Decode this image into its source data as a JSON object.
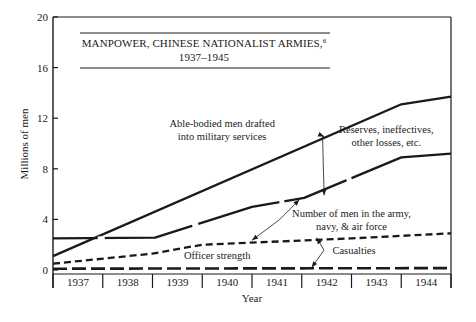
{
  "chart_data": {
    "type": "line",
    "title": "MANPOWER, CHINESE NATIONALIST ARMIES,",
    "title_footnote": "6",
    "subtitle": "1937–1945",
    "xlabel": "Year",
    "ylabel": "Millions of men",
    "ylim": [
      0,
      20
    ],
    "xlim": [
      1937,
      1945
    ],
    "yticks": [
      0,
      4,
      8,
      12,
      16,
      20
    ],
    "categories": [
      "1937",
      "1938",
      "1939",
      "1940",
      "1941",
      "1942",
      "1943",
      "1944"
    ],
    "grid": false,
    "legend": "none (inline annotations with arrows)",
    "series": [
      {
        "name": "Able-bodied men drafted into military services",
        "style": "solid",
        "x": [
          1937.0,
          1944.0,
          1945.0
        ],
        "values": [
          1.1,
          13.1,
          13.7
        ]
      },
      {
        "name": "Number of men in the army, navy, & air force",
        "style": "solid-broken",
        "x": [
          1937.0,
          1939.05,
          1941.0,
          1942.05,
          1944.0,
          1945.0
        ],
        "values": [
          2.5,
          2.55,
          5.0,
          5.7,
          8.9,
          9.2
        ]
      },
      {
        "name": "Officer strength",
        "style": "dashed",
        "x": [
          1937.0,
          1939.0,
          1940.0,
          1943.0,
          1945.0
        ],
        "values": [
          0.5,
          1.3,
          2.0,
          2.5,
          2.9
        ]
      },
      {
        "name": "Casualties",
        "style": "long-dashed",
        "x": [
          1937.0,
          1945.0
        ],
        "values": [
          0.1,
          0.15
        ]
      }
    ],
    "annotations": [
      {
        "text_lines": [
          "Able-bodied men drafted",
          "into military services"
        ],
        "x": 1940.4,
        "y": 11.3
      },
      {
        "text_lines": [
          "Reserves, ineffectives,",
          "other losses, etc."
        ],
        "x": 1943.7,
        "y": 10.8,
        "arrows_to": [
          [
            1942.45,
            10.55
          ],
          [
            1942.45,
            5.9
          ]
        ]
      },
      {
        "text_lines": [
          "Number of men in the army,",
          "navy, & air force"
        ],
        "x": 1943.0,
        "y": 4.2,
        "arrows_to": [
          [
            1941.95,
            5.55
          ],
          [
            1941.0,
            2.35
          ]
        ]
      },
      {
        "text_lines": [
          "Casualties"
        ],
        "x": 1943.05,
        "y": 1.25,
        "arrows_to": [
          [
            1942.3,
            2.55
          ],
          [
            1942.2,
            0.2
          ]
        ]
      },
      {
        "text_lines": [
          "Officer strength"
        ],
        "x": 1940.3,
        "y": 0.9
      }
    ]
  }
}
